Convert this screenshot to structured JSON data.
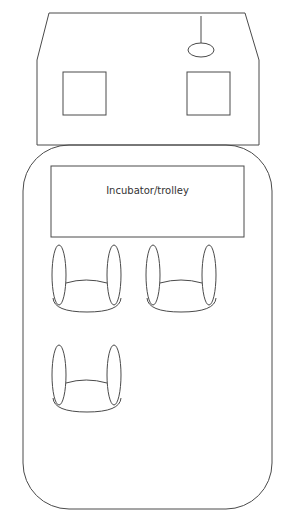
{
  "diagram": {
    "type": "floor-plan",
    "colors": {
      "stroke": "#4a4a4a",
      "text": "#333333",
      "background": "#ffffff"
    },
    "room": {
      "windows": [
        {
          "name": "left-window"
        },
        {
          "name": "right-window"
        }
      ],
      "ceiling_light": {
        "name": "pendant-light"
      }
    },
    "vehicle": {
      "incubator": {
        "label": "Incubator/trolley"
      },
      "seats": [
        {
          "name": "seat-1"
        },
        {
          "name": "seat-2"
        },
        {
          "name": "seat-3"
        }
      ]
    }
  }
}
